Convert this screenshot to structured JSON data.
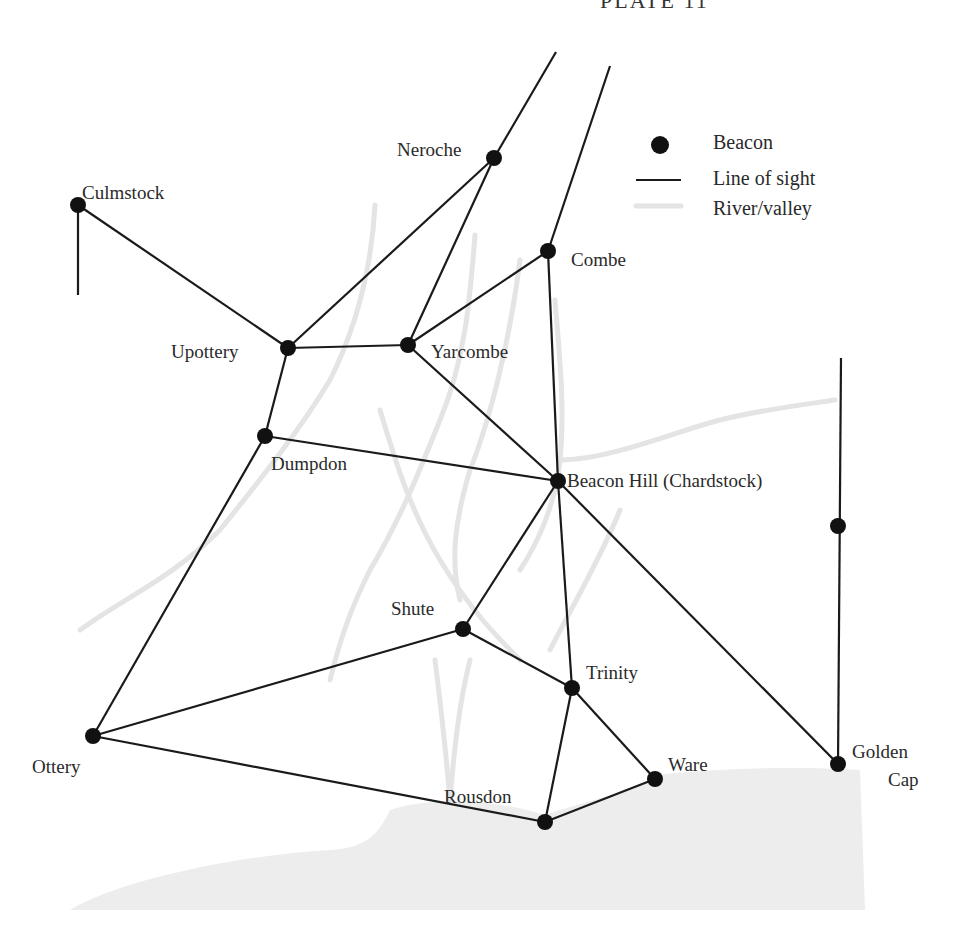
{
  "title": "PLATE 11",
  "legend": {
    "beacon": "Beacon",
    "line_of_sight": "Line of sight",
    "river_valley": "River/valley"
  },
  "beacons": {
    "culmstock": "Culmstock",
    "neroche": "Neroche",
    "combe": "Combe",
    "upottery": "Upottery",
    "yarcombe": "Yarcombe",
    "dumpdon": "Dumpdon",
    "beacon_hill": "Beacon Hill (Chardstock)",
    "shute": "Shute",
    "trinity": "Trinity",
    "ottery": "Ottery",
    "rousdon": "Rousdon",
    "ware": "Ware",
    "golden_cap_1": "Golden",
    "golden_cap_2": "Cap"
  },
  "colors": {
    "line": "#1a1a1a",
    "beacon": "#111111",
    "river": "#e6e6e6",
    "sea": "#ececec"
  }
}
